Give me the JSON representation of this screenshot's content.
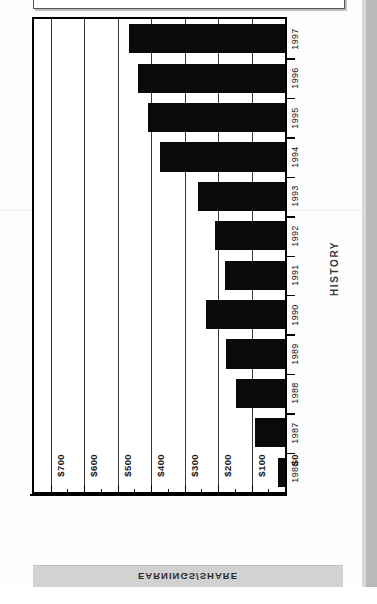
{
  "title": {
    "text": "CONTINUED HISTORY: EARNINGS PER SHARE"
  },
  "axes": {
    "category_axis_title": "HISTORY",
    "value_axis_title": "EARNINGS/SHARE"
  },
  "chart_data": {
    "type": "bar",
    "orientation": "horizontal",
    "title": "CONTINUED HISTORY: EARNINGS PER SHARE",
    "xlabel": "EARNINGS/SHARE",
    "ylabel": "HISTORY",
    "categories": [
      "1997",
      "1996",
      "1995",
      "1994",
      "1993",
      "1992",
      "1991",
      "1990",
      "1989",
      "1988",
      "1987",
      "1986"
    ],
    "values": [
      465,
      440,
      410,
      375,
      260,
      210,
      180,
      235,
      175,
      145,
      90,
      20
    ],
    "value_tick_labels": [
      "$700",
      "$600",
      "$500",
      "$400",
      "$300",
      "$200",
      "$100",
      "$0"
    ],
    "value_ticks": [
      700,
      600,
      500,
      400,
      300,
      200,
      100,
      0
    ],
    "minor_tick_step": 50,
    "xlim": [
      0,
      750
    ],
    "grid": true,
    "grid_axis": "value",
    "legend": "none",
    "bar_color": "#0a0a0a",
    "background_color": "#ffffff",
    "baseline_side": "right",
    "note": "Value axis runs right-to-left: $0 at right edge, $700 at left."
  }
}
